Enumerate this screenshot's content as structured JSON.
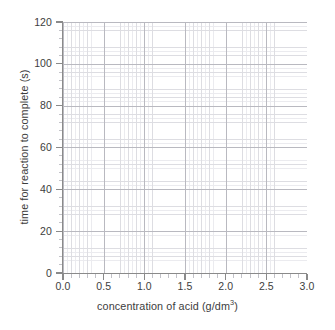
{
  "chart_data": {
    "type": "line",
    "title": "",
    "subtitle": "",
    "xlabel_text": "concentration of acid (g/dm",
    "xlabel_sup": "3",
    "xlabel_tail": ")",
    "xlabel_full": "concentration of acid (g/dm3)",
    "ylabel": "time for reaction to complete (s)",
    "xlim": [
      0.0,
      3.0
    ],
    "ylim": [
      0,
      120
    ],
    "xticks": [
      "0.0",
      "0.5",
      "1.0",
      "1.5",
      "2.0",
      "2.5",
      "3.0"
    ],
    "xtick_values": [
      0.0,
      0.5,
      1.0,
      1.5,
      2.0,
      2.5,
      3.0
    ],
    "yticks": [
      "120",
      "100",
      "80",
      "60",
      "40",
      "20",
      "0"
    ],
    "ytick_values": [
      120,
      100,
      80,
      60,
      40,
      20,
      0
    ],
    "x_minor_step": 0.1,
    "y_minor_step": 4,
    "grid": true,
    "grid_minor": true,
    "legend": "none",
    "series": [],
    "values": [],
    "categories": [],
    "annotations": [],
    "note": "blank graph grid with no plotted data points",
    "colors": {
      "background": "#ffffff",
      "grid_major": "#b9b9c0",
      "grid_minor": "#dddde2",
      "grid_fine": "#ebebef",
      "axis": "#8a8a8a",
      "text": "#3d3d3d"
    }
  }
}
